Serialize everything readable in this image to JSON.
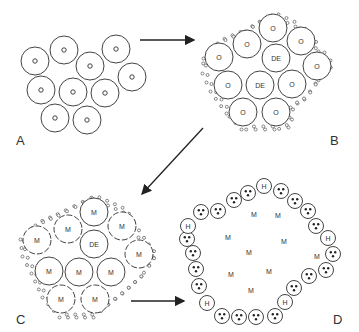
{
  "panels": [
    {
      "id": "A",
      "label": "A",
      "cell_label": "o",
      "description": "Loose cluster of cells with central nuclei"
    },
    {
      "id": "B",
      "label": "B",
      "cell_labels": [
        "O",
        "DE"
      ],
      "description": "Compacted cluster surrounded by small cells"
    },
    {
      "id": "C",
      "label": "C",
      "cell_labels": [
        "M",
        "DE"
      ],
      "description": "Cluster with M cells and dashed membranes"
    },
    {
      "id": "D",
      "label": "D",
      "cell_labels": [
        "H",
        "M"
      ],
      "description": "Ring of cells with three dots and H cells around interior M"
    }
  ],
  "labels": {
    "A": "A",
    "B": "B",
    "C": "C",
    "D": "D",
    "o": "o",
    "O": "O",
    "DE": "DE",
    "M": "M",
    "H": "H"
  },
  "arrows": [
    {
      "from": "A",
      "to": "B"
    },
    {
      "from": "B",
      "to": "C"
    },
    {
      "from": "C",
      "to": "D"
    }
  ],
  "colors": {
    "stroke": "#444444",
    "background": "#ffffff"
  }
}
